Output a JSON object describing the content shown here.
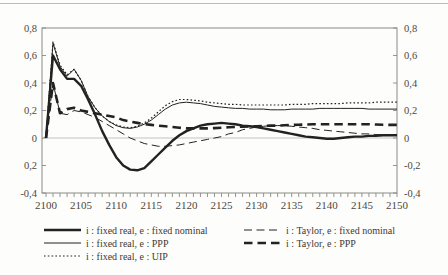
{
  "figure": {
    "background": "#fdfdfb",
    "top_rule_color": "#bdbdb8",
    "axis_color": "#8a8a86",
    "line_color": "#222222",
    "label_color": "#4c4841"
  },
  "chart_data": {
    "type": "line",
    "title": "",
    "xlabel": "",
    "ylabel": "",
    "x_start": 2100,
    "x_end": 2150,
    "x_step": 1,
    "x_tick_labels": [
      "2100",
      "2105",
      "2110",
      "2115",
      "2120",
      "2125",
      "2130",
      "2135",
      "2140",
      "2145",
      "2150"
    ],
    "ylim": [
      -0.4,
      0.8
    ],
    "y_tick_values": [
      0.8,
      0.6,
      0.4,
      0.2,
      0,
      -0.2,
      -0.4
    ],
    "y_tick_labels_left": [
      "0,8",
      "0,6",
      "0,4",
      "0,2",
      "0",
      "0,2",
      "-0,4"
    ],
    "y_tick_labels_right": [
      "0,8",
      "0,6",
      "0,4",
      "0,2",
      "0",
      "-0,2",
      "-0,4"
    ],
    "grid": "zero-line-only",
    "legend_position": "bottom-two-columns",
    "legend_columns": [
      [
        0,
        1,
        2
      ],
      [
        3,
        4
      ]
    ],
    "series": [
      {
        "name": "i : fixed real, e : fixed nominal",
        "style": "solid-thick",
        "values": [
          0,
          0.6,
          0.5,
          0.43,
          0.43,
          0.38,
          0.28,
          0.17,
          0.05,
          -0.05,
          -0.14,
          -0.2,
          -0.23,
          -0.235,
          -0.22,
          -0.17,
          -0.12,
          -0.07,
          -0.02,
          0.02,
          0.05,
          0.07,
          0.09,
          0.1,
          0.105,
          0.11,
          0.105,
          0.1,
          0.09,
          0.085,
          0.08,
          0.07,
          0.06,
          0.05,
          0.04,
          0.03,
          0.02,
          0.01,
          0.005,
          0,
          -0.005,
          -0.005,
          0,
          0.005,
          0.01,
          0.01,
          0.015,
          0.015,
          0.02,
          0.02,
          0.02
        ]
      },
      {
        "name": "i : fixed real, e : PPP",
        "style": "solid-thin",
        "values": [
          0,
          0.69,
          0.52,
          0.45,
          0.5,
          0.42,
          0.3,
          0.22,
          0.16,
          0.12,
          0.09,
          0.075,
          0.07,
          0.08,
          0.1,
          0.13,
          0.17,
          0.21,
          0.24,
          0.255,
          0.26,
          0.255,
          0.25,
          0.24,
          0.23,
          0.225,
          0.22,
          0.215,
          0.215,
          0.21,
          0.21,
          0.21,
          0.205,
          0.205,
          0.205,
          0.21,
          0.21,
          0.21,
          0.21,
          0.215,
          0.215,
          0.215,
          0.215,
          0.215,
          0.215,
          0.215,
          0.21,
          0.21,
          0.21,
          0.21,
          0.21
        ]
      },
      {
        "name": "i : fixed real, e : UIP",
        "style": "dotted",
        "values": [
          0,
          0.7,
          0.53,
          0.46,
          0.5,
          0.42,
          0.3,
          0.22,
          0.16,
          0.12,
          0.095,
          0.08,
          0.075,
          0.085,
          0.11,
          0.145,
          0.19,
          0.235,
          0.265,
          0.28,
          0.28,
          0.275,
          0.27,
          0.26,
          0.255,
          0.25,
          0.245,
          0.245,
          0.24,
          0.24,
          0.24,
          0.24,
          0.24,
          0.24,
          0.24,
          0.245,
          0.245,
          0.245,
          0.25,
          0.25,
          0.25,
          0.25,
          0.25,
          0.255,
          0.255,
          0.255,
          0.255,
          0.26,
          0.26,
          0.26,
          0.26
        ]
      },
      {
        "name": "i : Taylor, e : fixed nominal",
        "style": "dashed-thin",
        "values": [
          0,
          0.4,
          0.18,
          0.17,
          0.2,
          0.19,
          0.17,
          0.15,
          0.12,
          0.09,
          0.06,
          0.03,
          0,
          -0.02,
          -0.04,
          -0.05,
          -0.06,
          -0.06,
          -0.055,
          -0.05,
          -0.04,
          -0.03,
          -0.02,
          -0.01,
          0,
          0.01,
          0.03,
          0.04,
          0.06,
          0.07,
          0.08,
          0.085,
          0.09,
          0.09,
          0.09,
          0.085,
          0.08,
          0.075,
          0.07,
          0.06,
          0.055,
          0.05,
          0.045,
          0.04,
          0.035,
          0.03,
          0.03,
          0.025,
          0.025,
          0.02,
          0.02
        ]
      },
      {
        "name": "i : Taylor, e : PPP",
        "style": "dashed-thick",
        "values": [
          0,
          0.4,
          0.18,
          0.21,
          0.22,
          0.2,
          0.19,
          0.18,
          0.17,
          0.16,
          0.15,
          0.13,
          0.12,
          0.11,
          0.1,
          0.095,
          0.09,
          0.085,
          0.08,
          0.075,
          0.07,
          0.07,
          0.07,
          0.07,
          0.072,
          0.075,
          0.078,
          0.08,
          0.082,
          0.084,
          0.085,
          0.087,
          0.09,
          0.09,
          0.092,
          0.095,
          0.096,
          0.098,
          0.1,
          0.1,
          0.1,
          0.1,
          0.1,
          0.1,
          0.1,
          0.1,
          0.1,
          0.098,
          0.096,
          0.095,
          0.095
        ]
      }
    ]
  }
}
